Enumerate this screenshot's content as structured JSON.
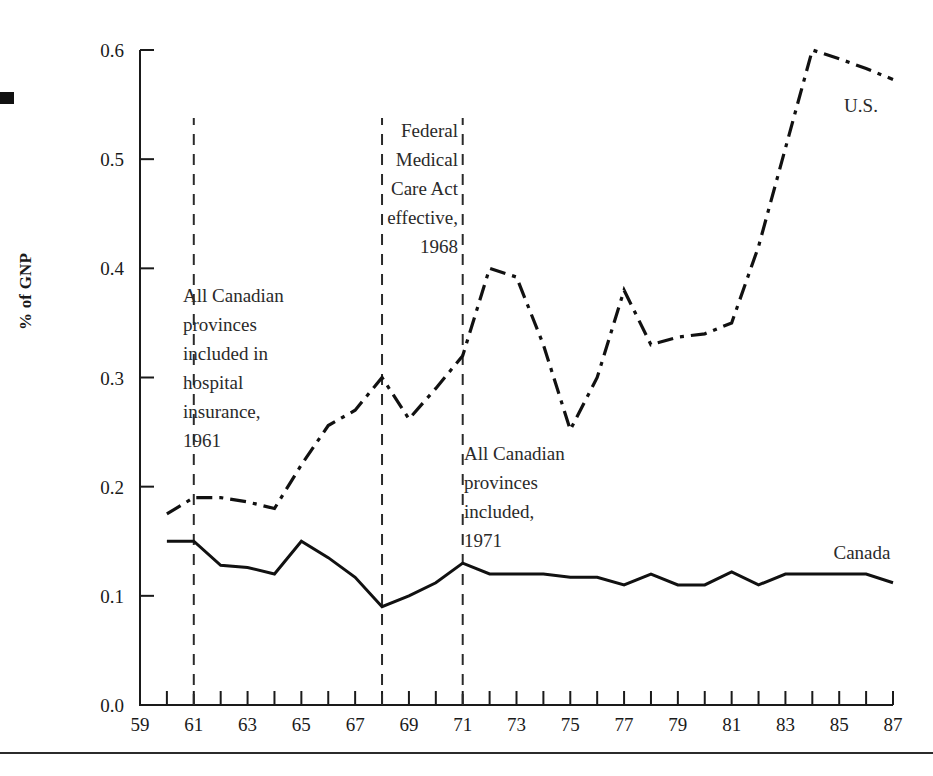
{
  "figure": {
    "corner_marker": "black-square-bleed",
    "y_axis_title": "% of GNP"
  },
  "chart_data": {
    "type": "line",
    "title": "",
    "xlabel": "",
    "ylabel": "% of GNP",
    "xlim": [
      59,
      87
    ],
    "ylim": [
      0.0,
      0.6
    ],
    "grid": false,
    "legend": "inline-labels",
    "y_ticks": [
      "0.0",
      "0.1",
      "0.2",
      "0.3",
      "0.4",
      "0.5",
      "0.6"
    ],
    "y_tick_values": [
      0.0,
      0.1,
      0.2,
      0.3,
      0.4,
      0.5,
      0.6
    ],
    "x_ticks": [
      "59",
      "61",
      "63",
      "65",
      "67",
      "69",
      "71",
      "73",
      "75",
      "77",
      "79",
      "81",
      "83",
      "85",
      "87"
    ],
    "x_tick_values": [
      59,
      61,
      63,
      65,
      67,
      69,
      71,
      73,
      75,
      77,
      79,
      81,
      83,
      85,
      87
    ],
    "x_minor_ticks": [
      60,
      62,
      64,
      66,
      68,
      70,
      72,
      74,
      76,
      78,
      80,
      82,
      84,
      86
    ],
    "x": [
      60,
      61,
      62,
      63,
      64,
      65,
      66,
      67,
      68,
      69,
      70,
      71,
      72,
      73,
      74,
      75,
      76,
      77,
      78,
      79,
      80,
      81,
      82,
      83,
      84,
      85,
      86,
      87
    ],
    "series": [
      {
        "name": "U.S.",
        "style": "dash-dot",
        "label": "U.S.",
        "values": [
          0.175,
          0.19,
          0.19,
          0.186,
          0.18,
          0.22,
          0.256,
          0.27,
          0.3,
          0.262,
          0.29,
          0.32,
          0.4,
          0.392,
          0.33,
          0.252,
          0.3,
          0.38,
          0.33,
          0.337,
          0.34,
          0.35,
          0.42,
          0.51,
          0.6,
          0.592,
          0.583,
          0.573
        ]
      },
      {
        "name": "Canada",
        "style": "solid",
        "label": "Canada",
        "values": [
          0.15,
          0.15,
          0.128,
          0.126,
          0.12,
          0.15,
          0.135,
          0.117,
          0.09,
          0.1,
          0.112,
          0.13,
          0.12,
          0.12,
          0.12,
          0.117,
          0.117,
          0.11,
          0.12,
          0.11,
          0.11,
          0.122,
          0.11,
          0.12,
          0.12,
          0.12,
          0.12,
          0.112
        ]
      }
    ],
    "annotations": [
      {
        "id": "hospital-insurance-1961",
        "event_year": 61,
        "align": "left",
        "lines": [
          "All Canadian",
          "provinces",
          "included in",
          "hospital",
          "insurance,",
          "1961"
        ]
      },
      {
        "id": "federal-medical-care-act-1968",
        "event_year": 68,
        "align": "right",
        "lines": [
          "Federal",
          "Medical",
          "Care Act",
          "effective,",
          "1968"
        ]
      },
      {
        "id": "all-provinces-included-1971",
        "event_year": 71,
        "align": "left",
        "lines": [
          "All Canadian",
          "provinces",
          "included,",
          "1971"
        ]
      }
    ],
    "event_lines": [
      61,
      68,
      71
    ]
  }
}
